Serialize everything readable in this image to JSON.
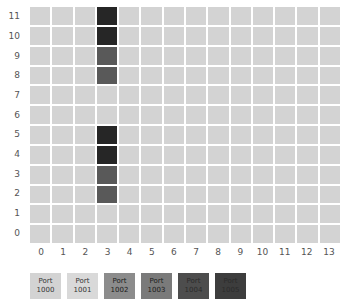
{
  "chart_data": {
    "type": "heatmap",
    "title": "",
    "xlabel": "",
    "ylabel": "",
    "xticklabels": [
      "0",
      "1",
      "2",
      "3",
      "4",
      "5",
      "6",
      "7",
      "8",
      "9",
      "10",
      "11",
      "12",
      "13"
    ],
    "yticklabels": [
      "11",
      "10",
      "9",
      "8",
      "7",
      "6",
      "5",
      "4",
      "3",
      "2",
      "1",
      "0"
    ],
    "xlim": [
      0,
      13
    ],
    "ylim": [
      0,
      11
    ],
    "grid": true,
    "legend_position": "bottom-left",
    "empty_color": "#d3d3d3",
    "background_color": "#ffffff",
    "gridline_color": "#ffffff",
    "ncols": 14,
    "nrows": 12,
    "legend": [
      {
        "label_line1": "Port",
        "label_line2": "1000",
        "color": "#d3d3d3",
        "text_color": "#333333"
      },
      {
        "label_line1": "Port",
        "label_line2": "1001",
        "color": "#d9d9d9",
        "text_color": "#333333"
      },
      {
        "label_line1": "Port",
        "label_line2": "1002",
        "color": "#8c8c8c",
        "text_color": "#1a1a1a"
      },
      {
        "label_line1": "Port",
        "label_line2": "1003",
        "color": "#7a7a7a",
        "text_color": "#1a1a1a"
      },
      {
        "label_line1": "Port",
        "label_line2": "1004",
        "color": "#4d4d4d",
        "text_color": "#2b2b2b"
      },
      {
        "label_line1": "Port",
        "label_line2": "1005",
        "color": "#3d3d3d",
        "text_color": "#2b2b2b"
      }
    ],
    "cells": [
      {
        "x": 3,
        "y": 11,
        "color": "#262626",
        "series": "Port 1005"
      },
      {
        "x": 3,
        "y": 10,
        "color": "#262626",
        "series": "Port 1005"
      },
      {
        "x": 3,
        "y": 9,
        "color": "#595959",
        "series": "Port 1004"
      },
      {
        "x": 3,
        "y": 8,
        "color": "#595959",
        "series": "Port 1004"
      },
      {
        "x": 3,
        "y": 5,
        "color": "#262626",
        "series": "Port 1005"
      },
      {
        "x": 3,
        "y": 4,
        "color": "#262626",
        "series": "Port 1005"
      },
      {
        "x": 3,
        "y": 3,
        "color": "#595959",
        "series": "Port 1004"
      },
      {
        "x": 3,
        "y": 2,
        "color": "#595959",
        "series": "Port 1004"
      }
    ]
  }
}
